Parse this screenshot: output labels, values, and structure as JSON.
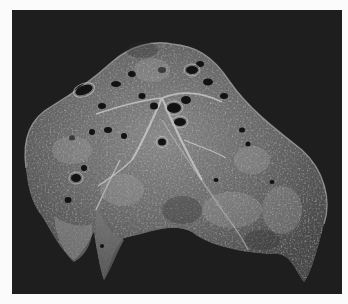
{
  "image": {
    "subject": "sectioned lung specimen",
    "description": "Grayscale gross pathology photograph of a cut lung surface on a dark background, showing dilated airways (cavities) and mottled parenchyma",
    "colors": {
      "page_background": "#fbfbfb",
      "photo_background": "#1e1e1e",
      "tissue_mid": "#6e6e6e",
      "tissue_light": "#b4b4b4",
      "tissue_dark": "#3a3a3a",
      "cavity": "#121212"
    }
  }
}
